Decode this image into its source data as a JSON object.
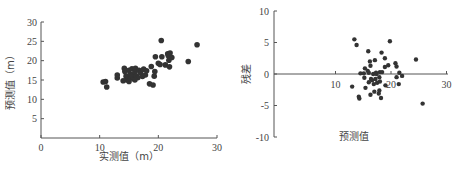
{
  "chart_data": [
    {
      "type": "scatter",
      "title": "",
      "xlabel": "实测值（m）",
      "ylabel": "预测值（m）",
      "xlim": [
        0,
        30
      ],
      "ylim": [
        0,
        30
      ],
      "xticks": [
        0,
        10,
        20,
        30
      ],
      "yticks": [
        5,
        10,
        15,
        20,
        25,
        30
      ],
      "grid": false,
      "legend": null,
      "points": [
        [
          10.6,
          14.5
        ],
        [
          11.0,
          14.6
        ],
        [
          11.2,
          13.2
        ],
        [
          13.0,
          15.5
        ],
        [
          13.0,
          16.3
        ],
        [
          14.2,
          18.0
        ],
        [
          14.3,
          17.2
        ],
        [
          14.5,
          16.0
        ],
        [
          14.6,
          15.0
        ],
        [
          14.8,
          15.8
        ],
        [
          15.0,
          17.5
        ],
        [
          15.2,
          16.5
        ],
        [
          15.3,
          15.5
        ],
        [
          15.5,
          17.9
        ],
        [
          15.6,
          16.2
        ],
        [
          15.8,
          15.3
        ],
        [
          16.0,
          17.0
        ],
        [
          16.1,
          18.0
        ],
        [
          16.3,
          16.0
        ],
        [
          16.5,
          15.6
        ],
        [
          16.7,
          17.5
        ],
        [
          17.0,
          16.8
        ],
        [
          17.3,
          15.9
        ],
        [
          17.5,
          17.8
        ],
        [
          17.8,
          16.3
        ],
        [
          18.0,
          17.4
        ],
        [
          18.5,
          14.0
        ],
        [
          18.8,
          18.5
        ],
        [
          19.1,
          13.7
        ],
        [
          19.3,
          16.0
        ],
        [
          19.4,
          17.2
        ],
        [
          19.5,
          21.0
        ],
        [
          20.0,
          19.3
        ],
        [
          20.3,
          19.0
        ],
        [
          20.5,
          25.2
        ],
        [
          20.6,
          21.0
        ],
        [
          21.2,
          18.9
        ],
        [
          21.6,
          21.8
        ],
        [
          21.7,
          21.3
        ],
        [
          21.8,
          20.1
        ],
        [
          21.9,
          18.4
        ],
        [
          22.3,
          20.8
        ],
        [
          22.0,
          22.0
        ],
        [
          25.1,
          19.8
        ],
        [
          26.6,
          24.1
        ],
        [
          14.0,
          14.8
        ],
        [
          15.0,
          14.6
        ],
        [
          16.0,
          15.0
        ]
      ]
    },
    {
      "type": "scatter",
      "title": "",
      "xlabel": "预测值",
      "ylabel": "残差",
      "xlim": [
        0,
        30
      ],
      "ylim": [
        -10,
        10
      ],
      "xticks": [
        10,
        20,
        30
      ],
      "yticks": [
        -10,
        -5,
        0,
        5,
        10
      ],
      "grid": false,
      "legend": null,
      "points": [
        [
          13.4,
          5.5
        ],
        [
          13.8,
          4.6
        ],
        [
          15.9,
          3.6
        ],
        [
          19.8,
          5.2
        ],
        [
          24.5,
          2.3
        ],
        [
          25.7,
          -4.7
        ],
        [
          18.3,
          3.4
        ],
        [
          18.9,
          2.5
        ],
        [
          17.1,
          2.2
        ],
        [
          16.2,
          2.0
        ],
        [
          16.3,
          1.3
        ],
        [
          18.9,
          1.1
        ],
        [
          19.5,
          1.4
        ],
        [
          20.8,
          1.7
        ],
        [
          21.0,
          1.2
        ],
        [
          15.3,
          0.9
        ],
        [
          15.8,
          0.5
        ],
        [
          14.5,
          0.1
        ],
        [
          15.1,
          0.1
        ],
        [
          16.0,
          0.2
        ],
        [
          16.8,
          0.0
        ],
        [
          17.3,
          0.2
        ],
        [
          18.0,
          0.3
        ],
        [
          18.4,
          0.3
        ],
        [
          21.5,
          0.2
        ],
        [
          22.0,
          -0.3
        ],
        [
          21.0,
          -0.5
        ],
        [
          15.2,
          -0.6
        ],
        [
          16.4,
          -0.8
        ],
        [
          17.2,
          -0.8
        ],
        [
          17.9,
          -0.5
        ],
        [
          16.0,
          -1.3
        ],
        [
          16.9,
          -1.6
        ],
        [
          17.5,
          -1.4
        ],
        [
          18.0,
          -1.2
        ],
        [
          21.4,
          -1.6
        ],
        [
          13.0,
          -2.0
        ],
        [
          15.4,
          -2.2
        ],
        [
          17.0,
          -2.8
        ],
        [
          17.9,
          -2.6
        ],
        [
          16.3,
          -3.3
        ],
        [
          17.8,
          -3.1
        ],
        [
          14.2,
          -3.6
        ],
        [
          14.3,
          -3.9
        ],
        [
          18.2,
          -3.8
        ],
        [
          16.6,
          -1.0
        ],
        [
          17.4,
          0.0
        ],
        [
          19.0,
          -1.8
        ]
      ]
    }
  ]
}
